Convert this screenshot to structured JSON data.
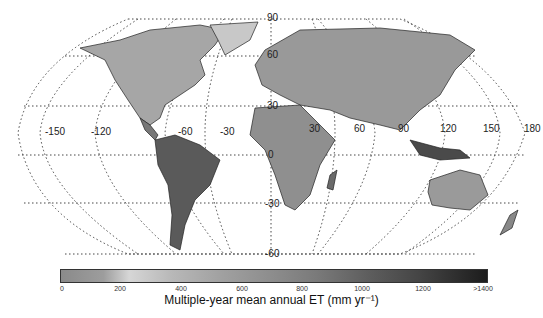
{
  "map": {
    "projection": "Robinson",
    "variable": "Multiple-year mean annual evapotranspiration (ET)",
    "longitude_labels": [
      "-150",
      "-120",
      "-60",
      "-30",
      "30",
      "60",
      "90",
      "120",
      "150",
      "180"
    ],
    "latitude_labels": [
      "90",
      "60",
      "30",
      "0",
      "-30",
      "-60"
    ],
    "colormap": "grayscale (light ~200, dark >1400)"
  },
  "colorbar": {
    "ticks": [
      "0",
      "200",
      "400",
      "600",
      "800",
      "1000",
      "1200",
      ">1400"
    ],
    "title": "Multiple-year mean annual ET (mm yr⁻¹)",
    "min": 0,
    "max": 1400
  }
}
